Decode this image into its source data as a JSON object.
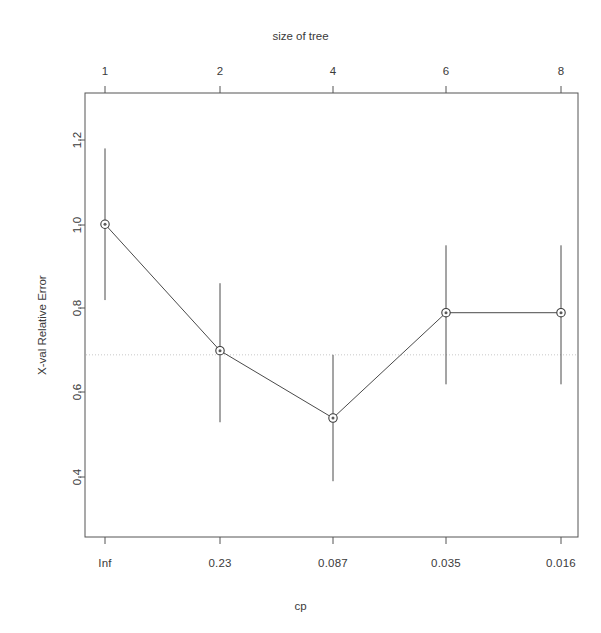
{
  "chart_data": {
    "type": "line",
    "title": "",
    "subtitle": "",
    "xlabel": "cp",
    "ylabel": "X-val Relative Error",
    "top_axis_label": "size of tree",
    "categories": [
      "Inf",
      "0.23",
      "0.087",
      "0.035",
      "0.016"
    ],
    "top_tick_labels": [
      "1",
      "2",
      "4",
      "6",
      "8"
    ],
    "y_tick_labels": [
      "1.2",
      "1.0",
      "0.8",
      "0.6",
      "0.4"
    ],
    "y_tick_values": [
      1.2,
      1.0,
      0.8,
      0.6,
      0.4
    ],
    "ylim": [
      0.33,
      1.28
    ],
    "xlim": [
      0.5,
      5.5
    ],
    "grid": false,
    "legend": "none",
    "values": [
      1.0,
      0.7,
      0.54,
      0.79,
      0.79
    ],
    "series": [
      {
        "name": "X-val Relative Error",
        "values": [
          1.0,
          0.7,
          0.54,
          0.79,
          0.79
        ],
        "err_upper": [
          1.18,
          0.86,
          0.69,
          0.95,
          0.95
        ],
        "err_lower": [
          0.82,
          0.53,
          0.39,
          0.62,
          0.62
        ]
      }
    ],
    "reference_line": {
      "orientation": "horizontal",
      "value": 0.69,
      "style": "dotted",
      "color": "#c8c8c8"
    },
    "colors": {
      "line": "#4a4a4a",
      "point_fill": "#ffffff",
      "point_stroke": "#3a3a3a",
      "axis": "#555555",
      "text": "#3a3a3a",
      "background": "#ffffff"
    }
  },
  "axes": {
    "top": {
      "title": "size of tree",
      "ticks": [
        {
          "label": "1",
          "x": 105
        },
        {
          "label": "2",
          "x": 220
        },
        {
          "label": "4",
          "x": 333
        },
        {
          "label": "6",
          "x": 446
        },
        {
          "label": "8",
          "x": 561
        }
      ]
    },
    "bottom": {
      "title": "cp",
      "ticks": [
        {
          "label": "Inf",
          "x": 105
        },
        {
          "label": "0.23",
          "x": 220
        },
        {
          "label": "0.087",
          "x": 333
        },
        {
          "label": "0.035",
          "x": 446
        },
        {
          "label": "0.016",
          "x": 561
        }
      ]
    },
    "left": {
      "title": "X-val Relative Error",
      "ticks": [
        {
          "label": "1.2",
          "y": 140
        },
        {
          "label": "1.0",
          "y": 225
        },
        {
          "label": "0.8",
          "y": 308
        },
        {
          "label": "0.6",
          "y": 392
        },
        {
          "label": "0.4",
          "y": 477
        }
      ]
    }
  }
}
